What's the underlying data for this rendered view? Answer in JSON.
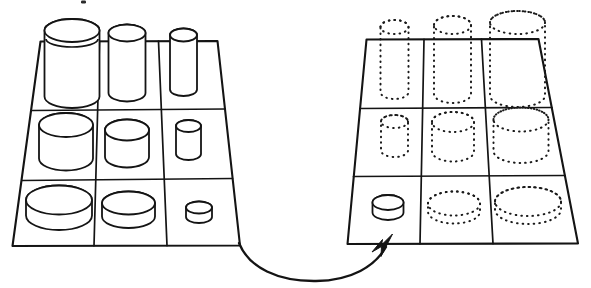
{
  "figure": {
    "title": "Cylinder sorting task: filled board transferred to empty board",
    "caption": "",
    "background_color": "#ffffff",
    "ink_color": "#141414",
    "width": 591,
    "height": 288
  },
  "source_board": {
    "name": "source-grid",
    "label": "Source board with cylinders",
    "rows": 3,
    "columns": 3,
    "style": "solid-outline",
    "cells": [
      {
        "row": 1,
        "col": 1,
        "occupied": true,
        "object": "cylinder",
        "diameter": "large",
        "height": "tall",
        "render": "solid"
      },
      {
        "row": 1,
        "col": 2,
        "occupied": true,
        "object": "cylinder",
        "diameter": "medium",
        "height": "tall",
        "render": "solid"
      },
      {
        "row": 1,
        "col": 3,
        "occupied": true,
        "object": "cylinder",
        "diameter": "small",
        "height": "tall",
        "render": "solid"
      },
      {
        "row": 2,
        "col": 1,
        "occupied": true,
        "object": "cylinder",
        "diameter": "large",
        "height": "medium",
        "render": "solid"
      },
      {
        "row": 2,
        "col": 2,
        "occupied": true,
        "object": "cylinder",
        "diameter": "medium",
        "height": "medium",
        "render": "solid"
      },
      {
        "row": 2,
        "col": 3,
        "occupied": true,
        "object": "cylinder",
        "diameter": "small",
        "height": "medium",
        "render": "solid"
      },
      {
        "row": 3,
        "col": 1,
        "occupied": true,
        "object": "cylinder",
        "diameter": "large",
        "height": "short",
        "render": "solid"
      },
      {
        "row": 3,
        "col": 2,
        "occupied": true,
        "object": "cylinder",
        "diameter": "medium",
        "height": "short",
        "render": "solid"
      },
      {
        "row": 3,
        "col": 3,
        "occupied": true,
        "object": "cylinder",
        "diameter": "small",
        "height": "short",
        "render": "solid"
      }
    ]
  },
  "target_board": {
    "name": "target-grid",
    "label": "Target board with dotted placeholder outlines",
    "rows": 3,
    "columns": 3,
    "style": "solid-outline",
    "placeholder_style": "dotted",
    "cells": [
      {
        "row": 1,
        "col": 1,
        "occupied": false,
        "object": "cylinder",
        "diameter": "small",
        "height": "tall",
        "render": "dotted"
      },
      {
        "row": 1,
        "col": 2,
        "occupied": false,
        "object": "cylinder",
        "diameter": "medium",
        "height": "tall",
        "render": "dotted"
      },
      {
        "row": 1,
        "col": 3,
        "occupied": false,
        "object": "cylinder",
        "diameter": "large",
        "height": "tall",
        "render": "dotted"
      },
      {
        "row": 2,
        "col": 1,
        "occupied": false,
        "object": "cylinder",
        "diameter": "small",
        "height": "medium",
        "render": "dotted"
      },
      {
        "row": 2,
        "col": 2,
        "occupied": false,
        "object": "cylinder",
        "diameter": "medium",
        "height": "medium",
        "render": "dotted"
      },
      {
        "row": 2,
        "col": 3,
        "occupied": false,
        "object": "cylinder",
        "diameter": "large",
        "height": "medium",
        "render": "dotted"
      },
      {
        "row": 3,
        "col": 1,
        "occupied": true,
        "object": "cylinder",
        "diameter": "small",
        "height": "short",
        "render": "solid"
      },
      {
        "row": 3,
        "col": 2,
        "occupied": false,
        "object": "cylinder",
        "diameter": "medium",
        "height": "short",
        "render": "dotted"
      },
      {
        "row": 3,
        "col": 3,
        "occupied": false,
        "object": "cylinder",
        "diameter": "large",
        "height": "short",
        "render": "dotted"
      }
    ]
  },
  "transfer_arrow": {
    "name": "transfer-arrow",
    "label": "Curved arrow from source board to target board",
    "direction": "left-to-right",
    "head_at": "target-board-bottom-left-cell",
    "style": "curved-solid"
  }
}
